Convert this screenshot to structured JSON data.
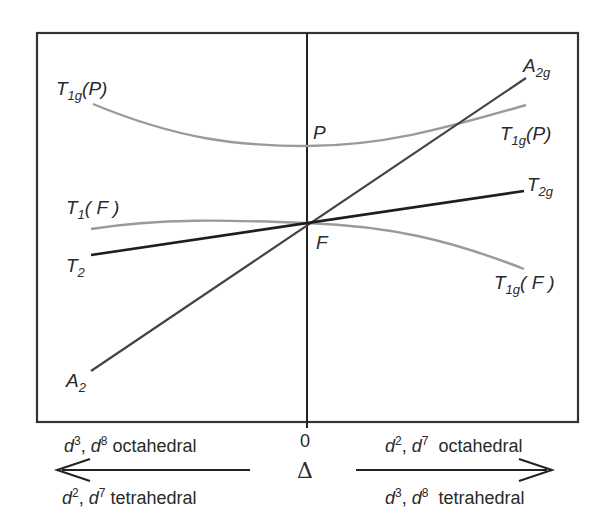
{
  "diagram": {
    "type": "orgel-energy-diagram",
    "x_axis": {
      "zero_label": "0",
      "symbol": "Δ"
    },
    "left_side": {
      "top_caption": {
        "e1": "d",
        "s1": "3",
        "sep": ", ",
        "e2": "d",
        "s2": "8",
        "text": " octahedral"
      },
      "bottom_caption": {
        "e1": "d",
        "s1": "2",
        "sep": ", ",
        "e2": "d",
        "s2": "7",
        "text": " tetrahedral"
      },
      "arrow_direction": "left"
    },
    "right_side": {
      "top_caption": {
        "e1": "d",
        "s1": "2",
        "sep": ", ",
        "e2": "d",
        "s2": "7",
        "text": "  octahedral"
      },
      "bottom_caption": {
        "e1": "d",
        "s1": "3",
        "sep": ", ",
        "e2": "d",
        "s2": "8",
        "text": "  tetrahedral"
      },
      "arrow_direction": "right"
    },
    "center_labels": {
      "P": "P",
      "F": "F"
    },
    "curve_labels": {
      "left_T1gP": {
        "main": "T",
        "sub": "1g",
        "tail": "(P)"
      },
      "left_T1F": {
        "main": "T",
        "sub": "1",
        "tail": "( F )"
      },
      "left_T2": {
        "main": "T",
        "sub": "2",
        "tail": ""
      },
      "left_A2": {
        "main": "A",
        "sub": "2",
        "tail": ""
      },
      "right_A2g": {
        "main": "A",
        "sub": "2g",
        "tail": ""
      },
      "right_T1gP": {
        "main": "T",
        "sub": "1g",
        "tail": "(P)"
      },
      "right_T2g": {
        "main": "T",
        "sub": "2g",
        "tail": ""
      },
      "right_T1gF": {
        "main": "T",
        "sub": "1g",
        "tail": "( F )"
      }
    },
    "colors": {
      "dark_line": "#2a2a2a",
      "mid_line": "#4a4a4a",
      "light_curve": "#9a9a9a",
      "frame": "#333333"
    }
  }
}
